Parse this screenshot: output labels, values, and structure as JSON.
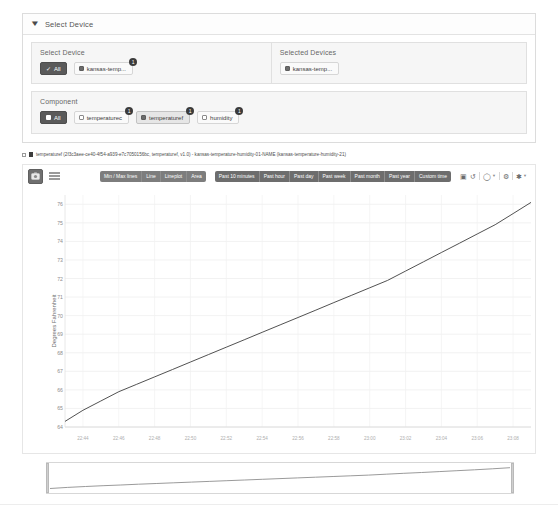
{
  "accordion": {
    "title": "Select Device",
    "chevron_icon": "chevron-down-icon"
  },
  "select_device": {
    "label": "Select Device",
    "all_button": "All",
    "devices": [
      {
        "label": "kansas-temp...",
        "badge": "1",
        "checked": true
      }
    ]
  },
  "selected_devices": {
    "label": "Selected Devices",
    "devices": [
      {
        "label": "kansas-temp...",
        "checked": true
      }
    ]
  },
  "component": {
    "label": "Component",
    "all_button": "All",
    "items": [
      {
        "label": "temperaturec",
        "badge": "1",
        "checked": false
      },
      {
        "label": "temperaturef",
        "badge": "1",
        "checked": true
      },
      {
        "label": "humidity",
        "badge": "1",
        "checked": false
      }
    ]
  },
  "series_header": {
    "text": "temperaturef (2f3c3aee-ce40-4f54-a939-e7c7050156bc, temperaturef, v1.0) - kansas-temperature-humidity-01-NAME (kansas-temperature-humidity-21)"
  },
  "chart_toolbar": {
    "screenshot_icon": "camera-icon",
    "list_icon": "list-icon",
    "chart_types": [
      "Min / Max lines",
      "Line",
      "Lineplot",
      "Area"
    ],
    "time_ranges": [
      "Past 10 minutes",
      "Past hour",
      "Past day",
      "Past week",
      "Past month",
      "Past year",
      "Custom time"
    ],
    "icons": [
      "camera-icon",
      "refresh-icon",
      "zoom-reset-icon",
      "gear-icon",
      "star-icon"
    ]
  },
  "chart_data": {
    "type": "line",
    "title": "",
    "xlabel": "",
    "ylabel": "Degrees Fahrenheit",
    "ylim": [
      64,
      76.5
    ],
    "yticks": [
      64,
      65,
      66,
      67,
      68,
      69,
      70,
      71,
      72,
      73,
      74,
      75,
      76
    ],
    "xticks": [
      "22:44",
      "22:46",
      "22:48",
      "22:50",
      "22:52",
      "22:54",
      "22:56",
      "22:58",
      "23:00",
      "23:02",
      "23:04",
      "23:06",
      "23:08"
    ],
    "grid": true,
    "legend": "none",
    "series": [
      {
        "name": "temperaturef",
        "color": "#3d3d3d",
        "x": [
          "22:43",
          "22:44",
          "22:45",
          "22:46",
          "22:47",
          "22:48",
          "22:49",
          "22:50",
          "22:51",
          "22:52",
          "22:53",
          "22:54",
          "22:55",
          "22:56",
          "22:57",
          "22:58",
          "22:59",
          "23:00",
          "23:01",
          "23:02",
          "23:03",
          "23:04",
          "23:05",
          "23:06",
          "23:07",
          "23:08",
          "23:09"
        ],
        "values": [
          64.3,
          64.9,
          65.4,
          65.9,
          66.3,
          66.7,
          67.1,
          67.5,
          67.9,
          68.3,
          68.7,
          69.1,
          69.5,
          69.9,
          70.3,
          70.7,
          71.1,
          71.5,
          71.9,
          72.4,
          72.9,
          73.4,
          73.9,
          74.4,
          74.9,
          75.5,
          76.1
        ]
      }
    ]
  },
  "navigator": {
    "left_handle": "range-handle-left",
    "right_handle": "range-handle-right"
  }
}
